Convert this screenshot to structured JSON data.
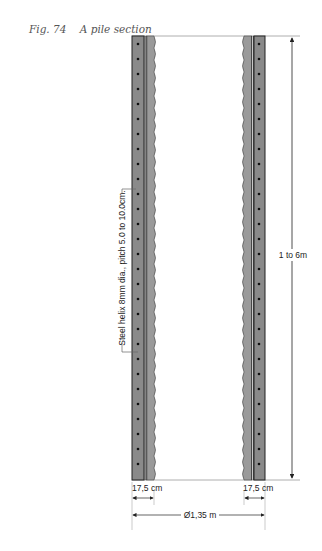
{
  "figure": {
    "number": "Fig. 74",
    "title": "A pile section"
  },
  "annotations": {
    "helix_label": "Steel helix 8mm dia., pitch 5.0 to 10.0cm.",
    "height_label": "1 to 6m",
    "wall_thickness_left": "17,5 cm",
    "wall_thickness_right": "17,5 cm",
    "diameter_label": "Ø1,35 m"
  },
  "colors": {
    "outer_wall": "#8a8a8a",
    "inner_wall": "#9a9a9a",
    "line": "#222222",
    "reinforcement_dot": "#111111"
  }
}
